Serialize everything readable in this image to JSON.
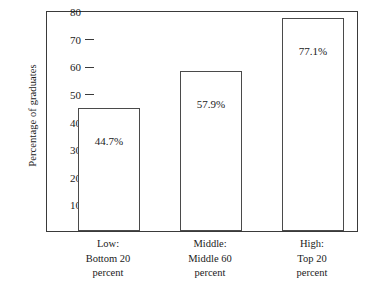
{
  "chart_data": {
    "type": "bar",
    "title": "",
    "xlabel": "",
    "ylabel": "Percentage of graduates",
    "ylim": [
      0,
      80
    ],
    "grid": false,
    "legend": "none",
    "yticks": [
      80,
      70,
      60,
      50,
      40,
      30,
      20,
      10
    ],
    "categories": [
      "Low:\nBottom 20\npercent",
      "Middle:\nMiddle 60\npercent",
      "High:\nTop 20\npercent"
    ],
    "category_lines": [
      [
        "Low:",
        "Bottom 20",
        "percent"
      ],
      [
        "Middle:",
        "Middle 60",
        "percent"
      ],
      [
        "High:",
        "Top 20",
        "percent"
      ]
    ],
    "values": [
      44.7,
      57.9,
      77.1
    ],
    "data_labels": [
      "44.7%",
      "57.9%",
      "77.1%"
    ],
    "bar_fill": "#ffffff",
    "bar_stroke": "#4a4a4a",
    "axis_color": "#3a3a3a"
  }
}
